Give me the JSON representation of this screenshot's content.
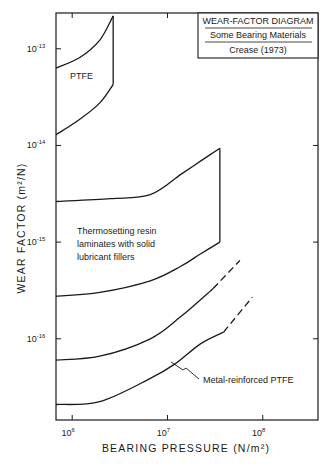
{
  "chart_data": {
    "type": "line",
    "title_box": {
      "line1": "WEAR-FACTOR DIAGRAM",
      "line2": "Some Bearing Materials",
      "line3": "Crease (1973)"
    },
    "xlabel": "BEARING PRESSURE (N/m²)",
    "ylabel": "WEAR FACTOR (m²/N)",
    "x_scale": "log",
    "y_scale": "log",
    "xlim_log10": [
      5.83,
      8.58
    ],
    "ylim_log10": [
      -16.84,
      -12.63
    ],
    "x_ticks": [
      {
        "base": "10",
        "exp": "6",
        "log10": 6
      },
      {
        "base": "10",
        "exp": "7",
        "log10": 7
      },
      {
        "base": "10",
        "exp": "8",
        "log10": 8
      }
    ],
    "y_ticks": [
      {
        "base": "10",
        "exp": "-13",
        "log10": -13
      },
      {
        "base": "10",
        "exp": "-14",
        "log10": -14
      },
      {
        "base": "10",
        "exp": "-15",
        "log10": -15
      },
      {
        "base": "10",
        "exp": "-16",
        "log10": -16
      }
    ],
    "grid": false,
    "regions": [
      {
        "name": "PTFE",
        "label_lines": [
          "PTFE"
        ],
        "upper_log10": [
          [
            5.83,
            -13.2
          ],
          [
            6.08,
            -13.09
          ],
          [
            6.29,
            -12.91
          ],
          [
            6.43,
            -12.66
          ]
        ],
        "lower_log10": [
          [
            5.83,
            -13.89
          ],
          [
            6.08,
            -13.73
          ],
          [
            6.29,
            -13.56
          ],
          [
            6.43,
            -13.37
          ]
        ]
      },
      {
        "name": "Thermosetting resin laminates with solid lubricant fillers",
        "label_lines": [
          "Thermosetting resin",
          "laminates with solid",
          "lubricant fillers"
        ],
        "upper_log10": [
          [
            5.83,
            -14.58
          ],
          [
            6.4,
            -14.55
          ],
          [
            6.82,
            -14.51
          ],
          [
            7.14,
            -14.3
          ],
          [
            7.35,
            -14.16
          ],
          [
            7.55,
            -14.03
          ]
        ],
        "lower_log10": [
          [
            5.83,
            -15.56
          ],
          [
            6.29,
            -15.52
          ],
          [
            6.82,
            -15.4
          ],
          [
            7.14,
            -15.25
          ],
          [
            7.35,
            -15.12
          ],
          [
            7.55,
            -15.0
          ]
        ]
      },
      {
        "name": "Metal-reinforced PTFE",
        "label_lines": [
          "Metal-reinforced PTFE"
        ],
        "upper_solid_log10": [
          [
            5.83,
            -16.22
          ],
          [
            6.29,
            -16.18
          ],
          [
            6.82,
            -16.0
          ],
          [
            7.14,
            -15.77
          ],
          [
            7.48,
            -15.48
          ]
        ],
        "upper_dashed_log10": [
          [
            7.48,
            -15.48
          ],
          [
            7.76,
            -15.19
          ]
        ],
        "lower_solid_log10": [
          [
            5.83,
            -16.68
          ],
          [
            6.29,
            -16.65
          ],
          [
            6.82,
            -16.41
          ],
          [
            7.08,
            -16.26
          ],
          [
            7.35,
            -16.05
          ],
          [
            7.59,
            -15.93
          ]
        ],
        "lower_dashed_log10": [
          [
            7.59,
            -15.93
          ],
          [
            7.89,
            -15.57
          ]
        ]
      }
    ]
  }
}
